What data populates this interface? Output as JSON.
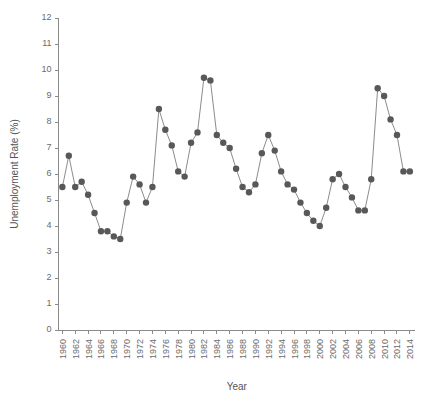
{
  "chart_data": {
    "type": "line",
    "title": "",
    "xlabel": "Year",
    "ylabel": "Unemployment Rate (%)",
    "xlim": [
      1959.4,
      2014.8
    ],
    "ylim": [
      0,
      12
    ],
    "grid": false,
    "legend": false,
    "marker": "filled-circle",
    "marker_color": "#585858",
    "line_color": "#8c8c8c",
    "ytick_labels": [
      "0",
      "1",
      "2",
      "3",
      "4",
      "5",
      "6",
      "7",
      "8",
      "9",
      "10",
      "11",
      "12"
    ],
    "yticks": [
      0,
      1,
      2,
      3,
      4,
      5,
      6,
      7,
      8,
      9,
      10,
      11,
      12
    ],
    "xtick_labels": [
      "1960",
      "1962",
      "1964",
      "1966",
      "1968",
      "1970",
      "1972",
      "1974",
      "1976",
      "1978",
      "1980",
      "1982",
      "1984",
      "1986",
      "1988",
      "1990",
      "1992",
      "1994",
      "1996",
      "1998",
      "2000",
      "2002",
      "2004",
      "2006",
      "2008",
      "2010",
      "2012",
      "2014"
    ],
    "xticks": [
      1960,
      1962,
      1964,
      1966,
      1968,
      1970,
      1972,
      1974,
      1976,
      1978,
      1980,
      1982,
      1984,
      1986,
      1988,
      1990,
      1992,
      1994,
      1996,
      1998,
      2000,
      2002,
      2004,
      2006,
      2008,
      2010,
      2012,
      2014
    ],
    "x": [
      1960,
      1961,
      1962,
      1963,
      1964,
      1965,
      1966,
      1967,
      1968,
      1969,
      1970,
      1971,
      1972,
      1973,
      1974,
      1975,
      1976,
      1977,
      1978,
      1979,
      1980,
      1981,
      1982,
      1983,
      1984,
      1985,
      1986,
      1987,
      1988,
      1989,
      1990,
      1991,
      1992,
      1993,
      1994,
      1995,
      1996,
      1997,
      1998,
      1999,
      2000,
      2001,
      2002,
      2003,
      2004,
      2005,
      2006,
      2007,
      2008,
      2009,
      2010,
      2011,
      2012,
      2013,
      2014
    ],
    "values": [
      5.5,
      6.7,
      5.5,
      5.7,
      5.2,
      4.5,
      3.8,
      3.8,
      3.6,
      3.5,
      4.9,
      5.9,
      5.6,
      4.9,
      5.5,
      8.5,
      7.7,
      7.1,
      6.1,
      5.9,
      7.2,
      7.6,
      9.7,
      9.6,
      7.5,
      7.2,
      7.0,
      6.2,
      5.5,
      5.3,
      5.6,
      6.8,
      7.5,
      6.9,
      6.1,
      5.6,
      5.4,
      4.9,
      4.5,
      4.2,
      4.0,
      4.7,
      5.8,
      6.0,
      5.5,
      5.1,
      4.6,
      4.6,
      5.8,
      9.3,
      9.0,
      8.1,
      7.5,
      6.1,
      6.1
    ],
    "series": [
      {
        "name": "Unemployment Rate",
        "values": [
          5.5,
          6.7,
          5.5,
          5.7,
          5.2,
          4.5,
          3.8,
          3.8,
          3.6,
          3.5,
          4.9,
          5.9,
          5.6,
          4.9,
          5.5,
          8.5,
          7.7,
          7.1,
          6.1,
          5.9,
          7.2,
          7.6,
          9.7,
          9.6,
          7.5,
          7.2,
          7.0,
          6.2,
          5.5,
          5.3,
          5.6,
          6.8,
          7.5,
          6.9,
          6.1,
          5.6,
          5.4,
          4.9,
          4.5,
          4.2,
          4.0,
          4.7,
          5.8,
          6.0,
          5.5,
          5.1,
          4.6,
          4.6,
          5.8,
          9.3,
          9.0,
          8.1,
          7.5,
          6.1,
          6.1
        ]
      }
    ]
  }
}
